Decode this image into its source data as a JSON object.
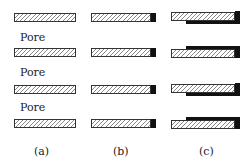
{
  "diagram": {
    "pore_label": "Pore",
    "captions": [
      "(a)",
      "(b)",
      "(c)"
    ],
    "columns": [
      {
        "id": "a",
        "x": 14,
        "width": 62,
        "end_cap": false,
        "side_film": false
      },
      {
        "id": "b",
        "x": 91,
        "width": 65,
        "end_cap": true,
        "side_film": false
      },
      {
        "id": "c",
        "x": 171,
        "width": 69,
        "end_cap": true,
        "side_film": true
      }
    ],
    "rows": [
      {
        "y": 13,
        "film_side": "bottom"
      },
      {
        "y": 48,
        "film_side": "top"
      },
      {
        "y": 85,
        "film_side": "bottom"
      },
      {
        "y": 119,
        "film_side": "top"
      }
    ],
    "pore_labels_y": [
      32,
      67,
      102
    ],
    "colors": {
      "hatch": "#888888",
      "outline": "#333333",
      "coating": "#111111"
    }
  }
}
